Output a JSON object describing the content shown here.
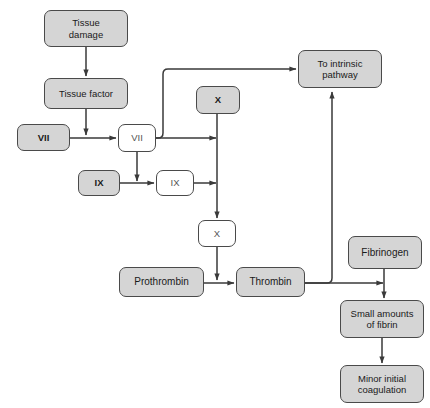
{
  "diagram": {
    "background_color": "#ffffff",
    "node_fill_gray": "#d5d5d5",
    "node_fill_white": "#ffffff",
    "border_color": "#4a4a4a",
    "edge_color": "#3a3a3a",
    "nodes": [
      {
        "id": "tissue-damage",
        "label": "Tissue\ndamage",
        "style": "filled",
        "x": 44,
        "y": 10,
        "w": 84,
        "h": 37,
        "font": "fs-small"
      },
      {
        "id": "tissue-factor",
        "label": "Tissue factor",
        "style": "filled",
        "x": 44,
        "y": 78,
        "w": 84,
        "h": 31,
        "font": "fs-small"
      },
      {
        "id": "factor-vii",
        "label": "VII",
        "style": "filled",
        "x": 17,
        "y": 124,
        "w": 53,
        "h": 27,
        "font": "fs-roman"
      },
      {
        "id": "factor-vii-active",
        "label": "VII",
        "style": "plain",
        "x": 118,
        "y": 124,
        "w": 38,
        "h": 28,
        "font": "fs-roman-light"
      },
      {
        "id": "factor-ix",
        "label": "IX",
        "style": "filled",
        "x": 78,
        "y": 170,
        "w": 42,
        "h": 26,
        "font": "fs-roman"
      },
      {
        "id": "factor-ix-active",
        "label": "IX",
        "style": "plain",
        "x": 156,
        "y": 170,
        "w": 38,
        "h": 26,
        "font": "fs-roman-light"
      },
      {
        "id": "factor-x",
        "label": "X",
        "style": "filled",
        "x": 196,
        "y": 86,
        "w": 44,
        "h": 28,
        "font": "fs-roman"
      },
      {
        "id": "factor-x-active",
        "label": "X",
        "style": "plain",
        "x": 198,
        "y": 220,
        "w": 38,
        "h": 27,
        "font": "fs-roman-light"
      },
      {
        "id": "to-intrinsic",
        "label": "To intrinsic\npathway",
        "style": "filled",
        "x": 298,
        "y": 50,
        "w": 84,
        "h": 38,
        "font": "fs-small"
      },
      {
        "id": "prothrombin",
        "label": "Prothrombin",
        "style": "filled",
        "x": 119,
        "y": 267,
        "w": 85,
        "h": 30,
        "font": "fs-normal"
      },
      {
        "id": "thrombin",
        "label": "Thrombin",
        "style": "filled",
        "x": 236,
        "y": 267,
        "w": 69,
        "h": 30,
        "font": "fs-normal"
      },
      {
        "id": "fibrinogen",
        "label": "Fibrinogen",
        "style": "filled",
        "x": 348,
        "y": 236,
        "w": 74,
        "h": 33,
        "font": "fs-normal"
      },
      {
        "id": "small-fibrin",
        "label": "Small amounts\nof fibrin",
        "style": "filled",
        "x": 340,
        "y": 300,
        "w": 84,
        "h": 38,
        "font": "fs-small"
      },
      {
        "id": "minor-coag",
        "label": "Minor initial\ncoagulation",
        "style": "filled",
        "x": 340,
        "y": 365,
        "w": 84,
        "h": 38,
        "font": "fs-small"
      }
    ],
    "edges": [
      {
        "id": "tissue-damage-to-tissue-factor",
        "from": "tissue-damage",
        "to": "tissue-factor",
        "arrow": true
      },
      {
        "id": "tissue-factor-to-vii-line",
        "from": "tissue-factor",
        "to": "vii-horizontal",
        "arrow": true
      },
      {
        "id": "vii-to-vii-active",
        "from": "factor-vii",
        "to": "factor-vii-active",
        "arrow": true
      },
      {
        "id": "vii-active-to-ix-line",
        "from": "factor-vii-active",
        "to": "ix-horizontal",
        "arrow": true
      },
      {
        "id": "ix-to-ix-active",
        "from": "factor-ix",
        "to": "factor-ix-active",
        "arrow": true
      },
      {
        "id": "ix-active-to-x-line",
        "from": "factor-ix-active",
        "to": "x-vertical",
        "arrow": true
      },
      {
        "id": "vii-active-to-x-line",
        "from": "factor-vii-active",
        "to": "x-vertical",
        "arrow": true
      },
      {
        "id": "vii-active-to-intrinsic",
        "from": "factor-vii-active",
        "to": "to-intrinsic",
        "arrow": true
      },
      {
        "id": "x-to-x-active",
        "from": "factor-x",
        "to": "factor-x-active",
        "arrow": true
      },
      {
        "id": "x-active-to-prothrombin-line",
        "from": "factor-x-active",
        "to": "prothrombin-line",
        "arrow": true
      },
      {
        "id": "prothrombin-to-thrombin",
        "from": "prothrombin",
        "to": "thrombin",
        "arrow": true
      },
      {
        "id": "thrombin-to-intrinsic",
        "from": "thrombin",
        "to": "to-intrinsic",
        "arrow": true
      },
      {
        "id": "thrombin-to-fibrinogen-line",
        "from": "thrombin",
        "to": "fibrinogen-line",
        "arrow": true
      },
      {
        "id": "fibrinogen-to-small-fibrin",
        "from": "fibrinogen",
        "to": "small-fibrin",
        "arrow": true
      },
      {
        "id": "small-fibrin-to-minor-coagulation",
        "from": "small-fibrin",
        "to": "minor-coag",
        "arrow": true
      }
    ]
  }
}
